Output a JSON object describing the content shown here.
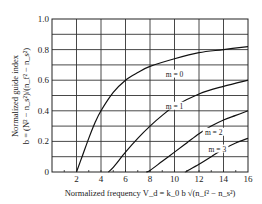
{
  "chart_data": {
    "type": "line",
    "title": "",
    "xlabel": "Normalized frequency V_d = k_0 b √(n_f² − n_s²)",
    "ylabel_line1": "Normalized guide index",
    "ylabel_line2": "b = (N² − n_s²)/(n_f² − n_s²)",
    "xlim": [
      0,
      16
    ],
    "ylim": [
      0,
      1.0
    ],
    "x_ticks": [
      "2",
      "4",
      "6",
      "8",
      "10",
      "12",
      "14",
      "16"
    ],
    "y_ticks": [
      "0",
      "0.2",
      "0.4",
      "0.6",
      "0.8",
      "1.0"
    ],
    "grid": true,
    "x_grid_step": 2,
    "y_grid_step": 0.1,
    "series": [
      {
        "name": "m = 0",
        "x": [
          2.0,
          2.5,
          3.0,
          3.5,
          4.0,
          5.0,
          6.0,
          7.0,
          8.0,
          10.0,
          12.0,
          14.0,
          16.0
        ],
        "y": [
          0.0,
          0.11,
          0.22,
          0.32,
          0.4,
          0.52,
          0.6,
          0.65,
          0.69,
          0.74,
          0.78,
          0.8,
          0.82
        ]
      },
      {
        "name": "m = 1",
        "x": [
          4.6,
          5.0,
          6.0,
          7.0,
          8.0,
          9.0,
          10.0,
          12.0,
          14.0,
          16.0
        ],
        "y": [
          0.0,
          0.03,
          0.13,
          0.22,
          0.3,
          0.37,
          0.43,
          0.51,
          0.56,
          0.6
        ]
      },
      {
        "name": "m = 2",
        "x": [
          7.7,
          8.0,
          9.0,
          10.0,
          11.0,
          12.0,
          13.0,
          14.0,
          15.0,
          16.0
        ],
        "y": [
          0.0,
          0.01,
          0.07,
          0.13,
          0.19,
          0.25,
          0.3,
          0.34,
          0.37,
          0.4
        ]
      },
      {
        "name": "m = 3",
        "x": [
          10.9,
          11.0,
          12.0,
          13.0,
          14.0,
          15.0,
          16.0
        ],
        "y": [
          0.0,
          0.005,
          0.05,
          0.1,
          0.15,
          0.19,
          0.22
        ]
      }
    ],
    "annotations": [
      {
        "text": "m = 0",
        "x": 10.0,
        "y": 0.63
      },
      {
        "text": "m = 1",
        "x": 10.0,
        "y": 0.42
      },
      {
        "text": "m = 2",
        "x": 13.2,
        "y": 0.25
      },
      {
        "text": "m = 3",
        "x": 13.5,
        "y": 0.14
      }
    ],
    "legend": "none (inline labels)"
  }
}
